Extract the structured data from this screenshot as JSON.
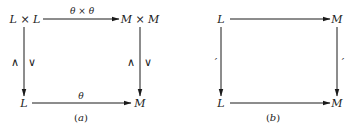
{
  "diagram_a": {
    "caption_letter": "a",
    "top_left": "L × L",
    "top_right": "M × M",
    "bottom_left": "L",
    "bottom_right": "M",
    "top_arrow_label": "θ × θ",
    "bottom_arrow_label": "θ",
    "left_arrow_label_1": "∧",
    "left_arrow_label_2": "∨",
    "right_arrow_label_1": "∧",
    "right_arrow_label_2": "∨"
  },
  "diagram_b": {
    "caption_letter": "b",
    "top_left": "L",
    "top_right": "M",
    "bottom_left": "L",
    "bottom_right": "M",
    "left_arrow_label": "′",
    "right_arrow_label": "′"
  },
  "caption_open": "(",
  "caption_close": ")",
  "colors": {
    "ink": "#1a1a1a",
    "background": "#ffffff"
  }
}
